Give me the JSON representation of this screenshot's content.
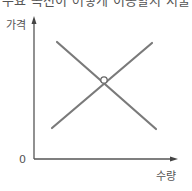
{
  "header": {
    "clipped_text": "수요 곡선이 어떻게 이동할지 서술"
  },
  "diagram": {
    "type": "supply-demand-cross",
    "y_axis_label": "가격",
    "x_axis_label": "수량",
    "origin_label": "0",
    "colors": {
      "axis": "#555555",
      "curve": "#7a7a7a",
      "equilibrium_point_fill": "#ffffff"
    },
    "lines": [
      {
        "name": "downward-sloping line",
        "from": [
          57,
          42
        ],
        "to": [
          156,
          129
        ]
      },
      {
        "name": "upward-sloping line",
        "from": [
          52,
          128
        ],
        "to": [
          152,
          43
        ]
      }
    ],
    "intersection": {
      "x": 104,
      "y": 80,
      "r": 3
    }
  }
}
